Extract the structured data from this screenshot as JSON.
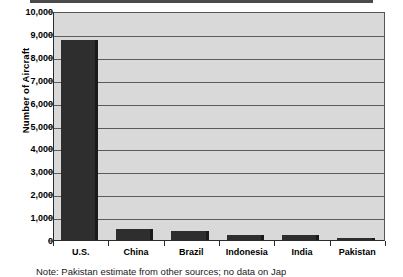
{
  "figure": {
    "background_color": "#ffffff",
    "plot_background_color": "#d9d9d9",
    "bar_color": "#2e2e2e",
    "gridline_color": "#5b5b5b",
    "axis_color": "#2a2a2a"
  },
  "chart_data": {
    "type": "bar",
    "title": "",
    "xlabel": "",
    "ylabel": "Number of Aircraft",
    "categories": [
      "U.S.",
      "China",
      "Brazil",
      "Indonesia",
      "India",
      "Pakistan"
    ],
    "values": [
      8750,
      500,
      400,
      200,
      200,
      100
    ],
    "ylim": [
      0,
      10000
    ],
    "ytick_labels": [
      "0",
      "1,000",
      "2,000",
      "3,000",
      "4,000",
      "5,000",
      "6,000",
      "7,000",
      "8,000",
      "9,000",
      "10,000"
    ],
    "ytick_values": [
      0,
      1000,
      2000,
      3000,
      4000,
      5000,
      6000,
      7000,
      8000,
      9000,
      10000
    ],
    "ytick_interval": 1000,
    "grid": true,
    "legend": null,
    "legend_position": "none",
    "series": [
      {
        "name": "Number of Aircraft",
        "values": [
          8750,
          500,
          400,
          200,
          200,
          100
        ]
      }
    ]
  },
  "caption": {
    "cut_off_text": "Note: Pakistan estimate from other sources; no data on Japan"
  }
}
